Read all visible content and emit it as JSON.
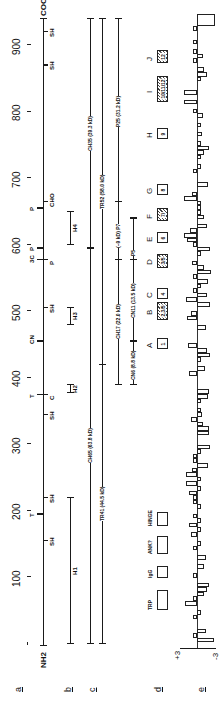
{
  "figure": {
    "orientation": "rotated 90 degrees counter-clockwise",
    "row_labels": [
      "a",
      "b",
      "c",
      "d",
      "e"
    ]
  },
  "axis": {
    "ticks": [
      "100",
      "200",
      "300",
      "400",
      "500",
      "600",
      "700",
      "800",
      "900"
    ],
    "n_terminus": "NH2",
    "c_terminus": "COOH"
  },
  "row_a_sites": [
    {
      "label": "SH",
      "residue": 155,
      "side": "right"
    },
    {
      "label": "T",
      "residue": 195,
      "side": "left"
    },
    {
      "label": "SH",
      "residue": 220,
      "side": "right"
    },
    {
      "label": "SH",
      "residue": 345,
      "side": "right"
    },
    {
      "label": "T",
      "residue": 375,
      "side": "left"
    },
    {
      "label": "C",
      "residue": 375,
      "side": "right"
    },
    {
      "label": "CN",
      "residue": 455,
      "side": "left"
    },
    {
      "label": "SH",
      "residue": 505,
      "side": "right"
    },
    {
      "label": "3C",
      "residue": 578,
      "side": "left"
    },
    {
      "label": "P",
      "residue": 578,
      "side": "right"
    },
    {
      "label": "P",
      "residue": 595,
      "side": "left"
    },
    {
      "label": "P",
      "residue": 655,
      "side": "left"
    },
    {
      "label": "CHO",
      "residue": 665,
      "side": "right"
    },
    {
      "label": "SH",
      "residue": 870,
      "side": "right"
    },
    {
      "label": "SH",
      "residue": 920,
      "side": "right"
    }
  ],
  "row_b_regions": [
    {
      "label": "H1",
      "start": 0,
      "end": 220
    },
    {
      "label": "H2",
      "start": 378,
      "end": 390
    },
    {
      "label": "H3",
      "start": 480,
      "end": 505
    },
    {
      "label": "H4",
      "start": 600,
      "end": 650
    }
  ],
  "row_c_fragments": [
    {
      "label": "CH65 (63.8 kD)",
      "start": 0,
      "end": 595
    },
    {
      "label": "CH35 (39.3 kD)",
      "start": 595,
      "end": 940
    },
    {
      "label": "TR41 (44.5 kD)",
      "start": 0,
      "end": 420
    },
    {
      "label": "TR52 (58.0 kD)",
      "start": 420,
      "end": 940
    },
    {
      "label": "CH17 (22.0 kD)",
      "start": 390,
      "end": 578
    },
    {
      "label": "(~9 kD) P7",
      "start": 578,
      "end": 665
    },
    {
      "label": "P25 (31.2 kD)",
      "start": 665,
      "end": 940
    },
    {
      "label": "CN6 (8.8 kD)",
      "start": 390,
      "end": 455
    },
    {
      "label": "CN11 (13.5 kD)",
      "start": 455,
      "end": 578
    },
    {
      "label": "P5",
      "start": 578,
      "end": 640
    }
  ],
  "row_d_domains": {
    "left_labels": [
      "TRP",
      "IgG",
      "ANK?",
      "HINGE"
    ],
    "repeats": [
      {
        "letter": "A",
        "number": "1",
        "hatched": false
      },
      {
        "letter": "B",
        "number": "2,3/5",
        "hatched": true
      },
      {
        "letter": "C",
        "number": "4",
        "hatched": false
      },
      {
        "letter": "D",
        "number": "3/5",
        "hatched": true
      },
      {
        "letter": "E",
        "number": "6",
        "hatched": false
      },
      {
        "letter": "F",
        "number": "7/",
        "hatched": true
      },
      {
        "letter": "G",
        "number": "8",
        "hatched": false
      },
      {
        "letter": "H",
        "number": "9",
        "hatched": false
      },
      {
        "letter": "I",
        "number": "10/11/12",
        "hatched": true
      },
      {
        "letter": "J",
        "number": "12",
        "hatched": true
      }
    ]
  },
  "row_e_hydropathy": {
    "scale_top": "+3",
    "scale_bottom": "-3"
  },
  "colors": {
    "ink": "#1a1a1a",
    "background": "#ffffff"
  }
}
